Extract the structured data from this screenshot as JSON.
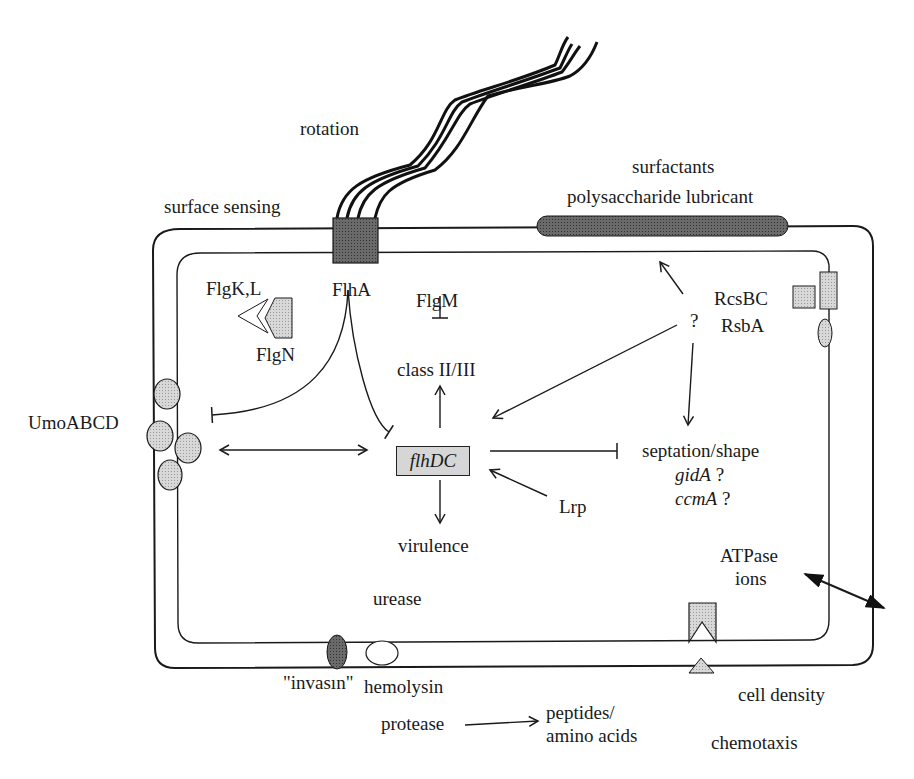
{
  "diagram": {
    "colors": {
      "line": "#1a1a1a",
      "fill_light": "#d6d6d6",
      "fill_dark": "#6e6e6e",
      "background": "#ffffff"
    },
    "labels": {
      "rotation": "rotation",
      "surface_sensing": "surface sensing",
      "surfactants": "surfactants",
      "polysaccharide_lubricant": "polysaccharide lubricant",
      "flga": "FlhA",
      "flgkl": "FlgK,L",
      "flgn": "FlgN",
      "flgm": "FlgM",
      "class": "class II/III",
      "question_top": "?",
      "rcsbc": "RcsBC",
      "rsba": "RsbA",
      "umoabcd": "UmoABCD",
      "flhdc": "flhDC",
      "septation": "septation/shape",
      "gida": "gidA",
      "gida_q": "?",
      "ccma": "ccmA",
      "ccma_q": "?",
      "lrp": "Lrp",
      "virulence": "virulence",
      "atpase": "ATPase",
      "ions": "ions",
      "urease": "urease",
      "invasin": "\"invasın\"",
      "hemolysin": "hemolysin",
      "cell_density": "cell density",
      "protease": "protease",
      "peptides": "peptides/",
      "amino_acids": "amino acids",
      "chemotaxis": "chemotaxis"
    }
  }
}
